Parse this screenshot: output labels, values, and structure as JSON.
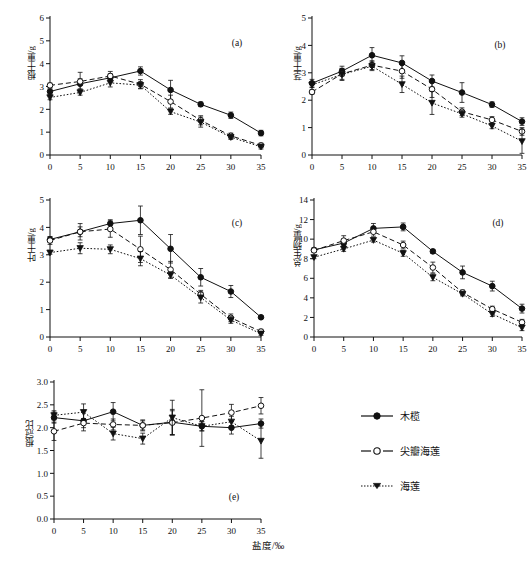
{
  "figure": {
    "x_axis_title": "盐度/‰",
    "x_categories": [
      0,
      5,
      10,
      15,
      20,
      25,
      30,
      35
    ],
    "legend": {
      "items": [
        {
          "label": "木榄",
          "marker": "filled-circle",
          "line": "solid"
        },
        {
          "label": "尖瓣海莲",
          "marker": "open-circle",
          "line": "dashed"
        },
        {
          "label": "海莲",
          "marker": "filled-triangle-down",
          "line": "dotted"
        }
      ]
    }
  },
  "chart_data": [
    {
      "id": "a",
      "type": "line",
      "title": "(a)",
      "xlabel": "盐度/‰",
      "ylabel": "根干重/g",
      "x": [
        0,
        5,
        10,
        15,
        20,
        25,
        30,
        35
      ],
      "xlim": [
        0,
        35
      ],
      "ylim": [
        0,
        6
      ],
      "yticks": [
        0,
        1,
        2,
        3,
        4,
        5,
        6
      ],
      "grid": false,
      "series": [
        {
          "name": "木榄",
          "values": [
            2.78,
            3.12,
            3.38,
            3.68,
            2.85,
            2.22,
            1.74,
            0.96
          ],
          "errors": [
            0.12,
            0.22,
            0.18,
            0.18,
            0.42,
            0.1,
            0.14,
            0.12
          ]
        },
        {
          "name": "尖瓣海莲",
          "values": [
            3.05,
            3.22,
            3.46,
            3.1,
            2.34,
            1.52,
            0.84,
            0.42
          ],
          "errors": [
            0.1,
            0.4,
            0.2,
            0.2,
            0.28,
            0.2,
            0.12,
            0.1
          ]
        },
        {
          "name": "海莲",
          "values": [
            2.52,
            2.74,
            3.16,
            3.06,
            1.9,
            1.44,
            0.78,
            0.36
          ],
          "errors": [
            0.1,
            0.12,
            0.18,
            0.14,
            0.12,
            0.22,
            0.1,
            0.1
          ]
        }
      ]
    },
    {
      "id": "b",
      "type": "line",
      "title": "(b)",
      "xlabel": "盐度/‰",
      "ylabel": "茎干重/g",
      "x": [
        0,
        5,
        10,
        15,
        20,
        25,
        30,
        35
      ],
      "xlim": [
        0,
        35
      ],
      "ylim": [
        0,
        5
      ],
      "yticks": [
        0,
        1,
        2,
        3,
        4,
        5
      ],
      "grid": false,
      "series": [
        {
          "name": "木榄",
          "values": [
            2.62,
            3.06,
            3.64,
            3.36,
            2.7,
            2.28,
            1.84,
            1.22
          ],
          "errors": [
            0.14,
            0.18,
            0.28,
            0.26,
            0.22,
            0.36,
            0.1,
            0.14
          ]
        },
        {
          "name": "尖瓣海莲",
          "values": [
            2.3,
            2.96,
            3.28,
            3.06,
            2.4,
            1.58,
            1.28,
            0.86
          ],
          "errors": [
            0.08,
            0.2,
            0.16,
            0.26,
            0.3,
            0.14,
            0.12,
            0.14
          ]
        },
        {
          "name": "海莲",
          "values": [
            2.56,
            2.94,
            3.24,
            2.58,
            1.9,
            1.5,
            1.06,
            0.5
          ],
          "errors": [
            0.1,
            0.22,
            0.16,
            0.3,
            0.42,
            0.12,
            0.1,
            0.44
          ]
        }
      ]
    },
    {
      "id": "c",
      "type": "line",
      "title": "(c)",
      "xlabel": "盐度/‰",
      "ylabel": "叶干重/g",
      "x": [
        0,
        5,
        10,
        15,
        20,
        25,
        30,
        35
      ],
      "xlim": [
        0,
        35
      ],
      "ylim": [
        0,
        5
      ],
      "yticks": [
        0,
        1,
        2,
        3,
        4,
        5
      ],
      "grid": false,
      "series": [
        {
          "name": "木榄",
          "values": [
            3.56,
            3.84,
            4.14,
            4.26,
            3.22,
            2.18,
            1.66,
            0.72
          ],
          "errors": [
            0.1,
            0.18,
            0.14,
            0.52,
            0.52,
            0.32,
            0.22,
            0.04
          ]
        },
        {
          "name": "尖瓣海莲",
          "values": [
            3.52,
            3.84,
            3.94,
            3.2,
            2.46,
            1.56,
            0.7,
            0.2
          ],
          "errors": [
            0.14,
            0.3,
            0.3,
            0.48,
            0.3,
            0.14,
            0.14,
            0.08
          ]
        },
        {
          "name": "海莲",
          "values": [
            3.08,
            3.24,
            3.2,
            2.86,
            2.26,
            1.44,
            0.62,
            0.12
          ],
          "errors": [
            0.06,
            0.2,
            0.16,
            0.26,
            0.12,
            0.2,
            0.12,
            0.06
          ]
        }
      ]
    },
    {
      "id": "d",
      "type": "line",
      "title": "(d)",
      "xlabel": "盐度/‰",
      "ylabel": "总生物量/g",
      "x": [
        0,
        5,
        10,
        15,
        20,
        25,
        30,
        35
      ],
      "xlim": [
        0,
        35
      ],
      "ylim": [
        0,
        14
      ],
      "yticks": [
        0,
        2,
        4,
        6,
        8,
        10,
        12,
        14
      ],
      "grid": false,
      "series": [
        {
          "name": "木榄",
          "values": [
            8.9,
            9.6,
            11.1,
            11.25,
            8.75,
            6.6,
            5.2,
            2.9
          ],
          "errors": [
            0.2,
            0.4,
            0.5,
            0.4,
            0.2,
            0.65,
            0.5,
            0.45
          ]
        },
        {
          "name": "尖瓣海莲",
          "values": [
            8.85,
            9.85,
            10.75,
            9.4,
            7.1,
            4.55,
            2.85,
            1.5
          ],
          "errors": [
            0.2,
            0.5,
            0.45,
            0.4,
            0.55,
            0.25,
            0.3,
            0.3
          ]
        },
        {
          "name": "海莲",
          "values": [
            8.15,
            9.0,
            9.9,
            8.55,
            6.1,
            4.4,
            2.35,
            0.95
          ],
          "errors": [
            0.15,
            0.25,
            0.2,
            0.3,
            0.35,
            0.2,
            0.25,
            0.3
          ]
        }
      ]
    },
    {
      "id": "e",
      "type": "line",
      "title": "(e)",
      "xlabel": "盐度/‰",
      "ylabel": "根冠比",
      "x": [
        0,
        5,
        10,
        15,
        20,
        25,
        30,
        35
      ],
      "xlim": [
        0,
        35
      ],
      "ylim": [
        0,
        3.0
      ],
      "yticks": [
        0.0,
        0.5,
        1.0,
        1.5,
        2.0,
        2.5,
        3.0
      ],
      "ytick_labels": [
        "0.0",
        "0.5",
        "1.0",
        "1.5",
        "2.0",
        "2.5",
        "3.0"
      ],
      "grid": false,
      "series": [
        {
          "name": "木榄",
          "values": [
            2.22,
            2.15,
            2.35,
            2.05,
            2.12,
            2.03,
            2.0,
            2.09
          ],
          "errors": [
            0.12,
            0.22,
            0.2,
            0.1,
            0.28,
            0.1,
            0.14,
            0.1
          ]
        },
        {
          "name": "尖瓣海莲",
          "values": [
            1.92,
            2.1,
            2.07,
            2.05,
            2.11,
            2.21,
            2.33,
            2.48
          ],
          "errors": [
            0.2,
            0.1,
            0.12,
            0.12,
            0.26,
            0.62,
            0.18,
            0.18
          ]
        },
        {
          "name": "海莲",
          "values": [
            2.27,
            2.34,
            1.87,
            1.76,
            2.22,
            2.03,
            2.13,
            1.71
          ],
          "errors": [
            0.1,
            0.18,
            0.14,
            0.12,
            0.38,
            0.1,
            0.12,
            0.38
          ]
        }
      ]
    }
  ]
}
